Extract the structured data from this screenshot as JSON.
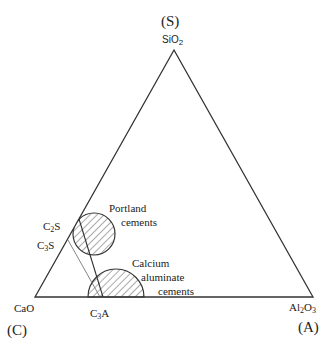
{
  "diagram": {
    "type": "ternary-phase-diagram",
    "vertices": {
      "top": {
        "system_letter": "(S)",
        "oxide_main": "SiO",
        "oxide_sub": "2"
      },
      "left": {
        "system_letter": "(C)",
        "oxide": "CaO"
      },
      "right": {
        "system_letter": "(A)",
        "oxide_main": "Al",
        "oxide_sub1": "2",
        "oxide_mid": "O",
        "oxide_sub2": "3"
      }
    },
    "points": {
      "c2s": {
        "main": "C",
        "sub": "2",
        "tail": "S"
      },
      "c3s": {
        "main": "C",
        "sub": "3",
        "tail": "S"
      },
      "c3a": {
        "main": "C",
        "sub": "3",
        "tail": "A"
      }
    },
    "regions": {
      "portland": {
        "line1": "Portland",
        "line2": "cements"
      },
      "calcium_aluminate": {
        "line1": "Calcium",
        "line2": "aluminate",
        "line3": "cements"
      }
    },
    "colors": {
      "line": "#333333",
      "hatch": "#555555",
      "background": "#ffffff"
    }
  }
}
